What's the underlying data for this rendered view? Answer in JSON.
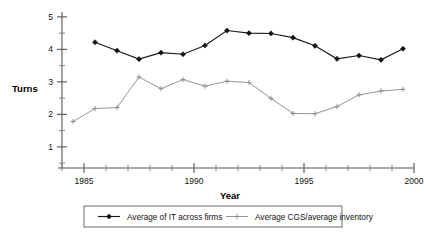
{
  "chart_data": {
    "type": "line",
    "title": "",
    "xlabel": "Year",
    "ylabel": "Turns",
    "xlim": [
      1984.0,
      2000.0
    ],
    "ylim": [
      0.35,
      5.15
    ],
    "grid": false,
    "legend_position": "bottom",
    "x_ticklabels": [
      "1985",
      "1990",
      "1995",
      "2000"
    ],
    "x_tickvalues": [
      1985,
      1990,
      1995,
      2000
    ],
    "x_minor_step": 1,
    "y_ticklabels": [
      "1",
      "2",
      "3",
      "4",
      "5"
    ],
    "y_tickvalues": [
      1,
      2,
      3,
      4,
      5
    ],
    "y_minor_step": 0.5,
    "series": [
      {
        "name": "Average of IT across firms",
        "marker": "filled-diamond",
        "color": "#1a1a1a",
        "x": [
          1985.5,
          1986.5,
          1987.5,
          1988.5,
          1989.5,
          1990.5,
          1991.5,
          1992.5,
          1993.5,
          1994.5,
          1995.5,
          1996.5,
          1997.5,
          1998.5,
          1999.5
        ],
        "values": [
          4.22,
          3.96,
          3.7,
          3.9,
          3.85,
          4.12,
          4.58,
          4.5,
          4.49,
          4.36,
          4.11,
          3.71,
          3.81,
          3.68,
          4.02
        ]
      },
      {
        "name": "Average CGS/average inventory",
        "marker": "plus",
        "color": "#8a8a8a",
        "x": [
          1984.5,
          1985.5,
          1986.5,
          1987.5,
          1988.5,
          1989.5,
          1990.5,
          1991.5,
          1992.5,
          1993.5,
          1994.5,
          1995.5,
          1996.5,
          1997.5,
          1998.5,
          1999.5
        ],
        "values": [
          1.78,
          2.18,
          2.21,
          3.15,
          2.79,
          3.07,
          2.87,
          3.02,
          2.98,
          2.49,
          2.03,
          2.02,
          2.24,
          2.6,
          2.72,
          2.77
        ]
      }
    ]
  },
  "legend": {
    "entries": [
      {
        "label": "Average of IT across firms",
        "marker": "filled-diamond"
      },
      {
        "label": "Average CGS/average inventory",
        "marker": "plus"
      }
    ]
  }
}
